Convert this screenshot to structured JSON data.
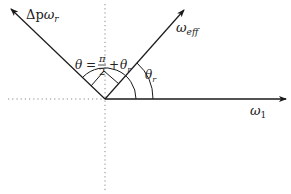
{
  "diagram": {
    "type": "vector-angle-diagram",
    "colors": {
      "line": "#1a1a1a",
      "axis_dotted": "#888888",
      "background": "#ffffff"
    },
    "origin": {
      "x": 105,
      "y": 99
    },
    "vectors": [
      {
        "id": "omega1",
        "label_main": "ω",
        "label_sub": "1",
        "direction": "horizontal-right"
      },
      {
        "id": "delta_p_omega_r",
        "label_prefix": "Δp",
        "label_main": "ω",
        "label_sub": "r",
        "direction": "upper-left"
      },
      {
        "id": "omega_eff",
        "label_main": "ω",
        "label_sub": "eff",
        "direction": "upper-right-45deg"
      }
    ],
    "angles": [
      {
        "id": "theta_r",
        "symbol": "θ",
        "sub": "r",
        "between": [
          "omega1",
          "omega_eff"
        ]
      },
      {
        "id": "theta",
        "lhs": "θ",
        "equals": "=",
        "frac_num": "π",
        "frac_den": "2",
        "plus": "+",
        "rhs_symbol": "θ",
        "rhs_sub": "r",
        "between": [
          "omega1",
          "delta_p_omega_r"
        ]
      }
    ],
    "right_angle_marker": {
      "between": [
        "omega_eff",
        "delta_p_omega_r"
      ]
    },
    "axes": {
      "horizontal_dotted": "left-of-origin",
      "vertical_dotted": "through-origin"
    }
  }
}
